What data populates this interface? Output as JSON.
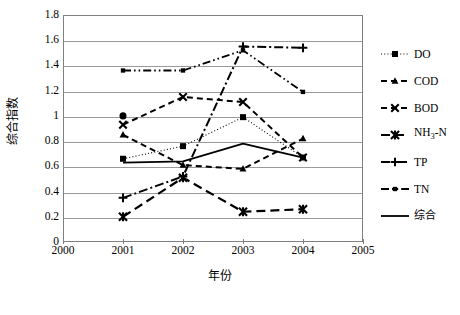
{
  "chart_data": {
    "type": "line",
    "title": "",
    "xlabel": "年份",
    "ylabel": "综合指数",
    "x": [
      2001,
      2002,
      2003,
      2004
    ],
    "xlim": [
      2000,
      2005
    ],
    "ylim": [
      0,
      1.8
    ],
    "xticks": [
      "2000",
      "2001",
      "2002",
      "2003",
      "2004",
      "2005"
    ],
    "yticks": [
      "0",
      "0.2",
      "0.4",
      "0.6",
      "0.8",
      "1",
      "1.2",
      "1.4",
      "1.6",
      "1.8"
    ],
    "grid": "horizontal",
    "legend_position": "right",
    "series": [
      {
        "name": "DO",
        "marker": "square",
        "dash": "dotted",
        "x": [
          2001,
          2002,
          2003,
          2004
        ],
        "values": [
          0.66,
          0.76,
          0.99,
          0.67
        ]
      },
      {
        "name": "COD",
        "marker": "triangle",
        "dash": "dashed",
        "x": [
          2001,
          2002,
          2003,
          2004
        ],
        "values": [
          0.85,
          0.61,
          0.58,
          0.82
        ]
      },
      {
        "name": "BOD",
        "marker": "x-cross",
        "dash": "dashed",
        "x": [
          2001,
          2002,
          2003,
          2004
        ],
        "values": [
          0.93,
          1.15,
          1.11,
          0.67
        ]
      },
      {
        "name": "NH3-N",
        "marker": "asterisk",
        "dash": "long-dash",
        "x": [
          2001,
          2002,
          2003,
          2004
        ],
        "values": [
          0.2,
          0.51,
          0.24,
          0.26
        ]
      },
      {
        "name": "TP",
        "marker": "plus",
        "dash": "dash-dot",
        "x": [
          2001,
          2002,
          2003,
          2004
        ],
        "values": [
          0.35,
          0.52,
          1.55,
          1.54
        ]
      },
      {
        "name": "TN",
        "marker": "small-square",
        "dash": "dash-dot-dot",
        "x": [
          2001,
          2002,
          2003,
          2004
        ],
        "values": [
          1.36,
          1.36,
          1.52,
          1.19
        ]
      },
      {
        "name": "综合",
        "marker": "none",
        "dash": "solid",
        "x": [
          2001,
          2002,
          2003,
          2004
        ],
        "values": [
          0.63,
          0.64,
          0.78,
          0.67
        ]
      }
    ],
    "legend": [
      "DO",
      "COD",
      "BOD",
      "NH3-N",
      "TP",
      "TN",
      "综合"
    ]
  },
  "legend_display": [
    {
      "label": "DO",
      "cjk": false
    },
    {
      "label": "COD",
      "cjk": false
    },
    {
      "label": "BOD",
      "cjk": false
    },
    {
      "label": "NH₃-N",
      "cjk": false
    },
    {
      "label": "TP",
      "cjk": false
    },
    {
      "label": "TN",
      "cjk": false
    },
    {
      "label": "综合",
      "cjk": true
    }
  ],
  "colors": {
    "line": "#000000",
    "grid": "#9a9a9a",
    "axis": "#808080",
    "background": "#ffffff"
  }
}
